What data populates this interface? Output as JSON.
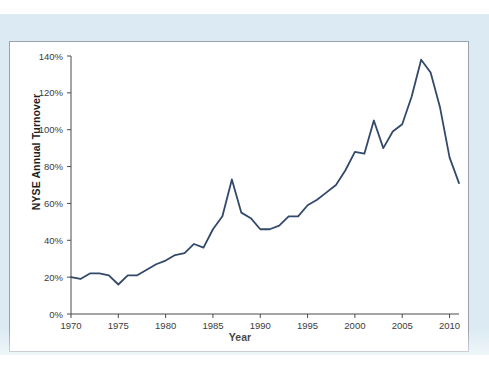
{
  "page": {
    "bleed_text": "",
    "mat_color": "#dcebf3",
    "panel_background": "#ffffff",
    "panel_border_color": "#9aa3ab"
  },
  "chart_data": {
    "type": "line",
    "title": "",
    "xlabel": "Year",
    "ylabel": "NYSE Annual Turnover",
    "xlim": [
      1970,
      2011
    ],
    "ylim": [
      0,
      140
    ],
    "grid": false,
    "legend": "none",
    "line_color": "#33496b",
    "line_width": 1.8,
    "y_tick_labels": [
      "0%",
      "20%",
      "40%",
      "60%",
      "80%",
      "100%",
      "120%",
      "140%"
    ],
    "y_tick_values": [
      0,
      20,
      40,
      60,
      80,
      100,
      120,
      140
    ],
    "x_tick_labels": [
      "1970",
      "1975",
      "1980",
      "1985",
      "1990",
      "1995",
      "2000",
      "2005",
      "2010"
    ],
    "x_tick_values": [
      1970,
      1975,
      1980,
      1985,
      1990,
      1995,
      2000,
      2005,
      2010
    ],
    "x": [
      1970,
      1971,
      1972,
      1973,
      1974,
      1975,
      1976,
      1977,
      1978,
      1979,
      1980,
      1981,
      1982,
      1983,
      1984,
      1985,
      1986,
      1987,
      1988,
      1989,
      1990,
      1991,
      1992,
      1993,
      1994,
      1995,
      1996,
      1997,
      1998,
      1999,
      2000,
      2001,
      2002,
      2003,
      2004,
      2005,
      2006,
      2007,
      2008,
      2009,
      2010,
      2011
    ],
    "values": [
      20,
      19,
      22,
      22,
      21,
      16,
      21,
      21,
      24,
      27,
      29,
      32,
      33,
      38,
      36,
      46,
      53,
      73,
      55,
      52,
      46,
      46,
      48,
      53,
      53,
      59,
      62,
      66,
      70,
      78,
      88,
      87,
      105,
      90,
      99,
      103,
      118,
      138,
      131,
      112,
      85,
      71
    ],
    "annotations": [
      {
        "year": 1987,
        "value": 73,
        "note": "1987 crash spike"
      },
      {
        "year": 2008,
        "value": 138,
        "note": "peak turnover"
      },
      {
        "year": 2011,
        "value": 71,
        "note": "series end"
      }
    ]
  }
}
